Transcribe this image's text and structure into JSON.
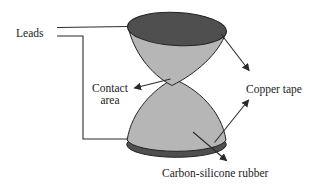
{
  "diagram": {
    "labels": {
      "leads": "Leads",
      "contact_line1": "Contact",
      "contact_line2": "area",
      "copper_tape": "Copper tape",
      "carbon_silicone_rubber": "Carbon-silicone rubber"
    },
    "colors": {
      "background": "#ffffff",
      "copper_tape_fill": "#4f4f4f",
      "rubber_fill": "#b6b6b6",
      "outline": "#222222",
      "line_color": "#2b2b2b",
      "text_color": "#1c1c1c"
    }
  }
}
